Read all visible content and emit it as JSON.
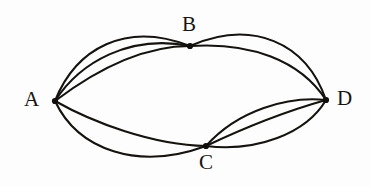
{
  "figure": {
    "kind": "multigraph-diagram",
    "background_color": "#fdfdfd",
    "stroke_color": "#15130f",
    "label_color": "#171411",
    "width": 371,
    "height": 186
  },
  "graph": {
    "vertices": [
      {
        "id": "A",
        "label": "A",
        "x": 55,
        "y": 101,
        "degree": 5,
        "label_x": 24,
        "label_y": 89
      },
      {
        "id": "B",
        "label": "B",
        "x": 190,
        "y": 46,
        "degree": 4,
        "label_x": 182,
        "label_y": 14
      },
      {
        "id": "C",
        "label": "C",
        "x": 206,
        "y": 146,
        "degree": 5,
        "label_x": 199,
        "label_y": 152
      },
      {
        "id": "D",
        "label": "D",
        "x": 326,
        "y": 100,
        "degree": 5,
        "label_x": 337,
        "label_y": 88
      }
    ],
    "edges": [
      {
        "id": "e1",
        "from": "A",
        "to": "B",
        "multiplicity_index": 1,
        "path": "M 55 101 C 76 48 126 21 190 46",
        "width": 2.1
      },
      {
        "id": "e2",
        "from": "A",
        "to": "B",
        "multiplicity_index": 2,
        "path": "M 55 101 C 80 62 130 34 190 46",
        "width": 2.1
      },
      {
        "id": "e3",
        "from": "A",
        "to": "B",
        "multiplicity_index": 3,
        "path": "M 55 101 C 88 76 136 46 190 46",
        "width": 2.1
      },
      {
        "id": "e4",
        "from": "B",
        "to": "D",
        "multiplicity_index": 1,
        "path": "M 190 46 C 252 19 306 42 326 100",
        "width": 2.1
      },
      {
        "id": "e5",
        "from": "B",
        "to": "D",
        "multiplicity_index": 2,
        "path": "M 190 46 C 250 42 300 60 326 100",
        "width": 2.1
      },
      {
        "id": "e6",
        "from": "A",
        "to": "C",
        "multiplicity_index": 1,
        "path": "M 55 101 C 92 122 152 145 206 146",
        "width": 2.1
      },
      {
        "id": "e7",
        "from": "A",
        "to": "C",
        "multiplicity_index": 2,
        "path": "M 55 101 C 78 150 138 171 206 146",
        "width": 2.1
      },
      {
        "id": "e8",
        "from": "C",
        "to": "D",
        "multiplicity_index": 1,
        "path": "M 206 146 C 238 110 288 96 326 100",
        "width": 2.1
      },
      {
        "id": "e9",
        "from": "C",
        "to": "D",
        "multiplicity_index": 2,
        "path": "M 206 146 C 248 126 294 109 326 100",
        "width": 2.1
      },
      {
        "id": "e10",
        "from": "C",
        "to": "D",
        "multiplicity_index": 3,
        "path": "M 206 146 C 256 152 306 134 326 100",
        "width": 2.1
      }
    ],
    "edge_multiplicity": {
      "A_B": 3,
      "B_D": 2,
      "A_C": 2,
      "C_D": 3
    }
  }
}
